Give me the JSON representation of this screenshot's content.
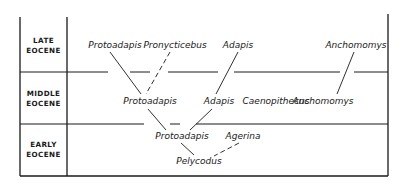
{
  "epochs": [
    {
      "id": "late",
      "line1": "LATE",
      "line2": "EOCENE"
    },
    {
      "id": "middle",
      "line1": "MIDDLE",
      "line2": "EOCENE"
    },
    {
      "id": "early",
      "line1": "EARLY",
      "line2": "EOCENE"
    }
  ],
  "taxa": {
    "late": [
      "Protoadapis",
      "Pronycticebus",
      "Adapis",
      "Anchomomys"
    ],
    "middle": [
      "Protoadapis",
      "Adapis",
      "Caenopithecus",
      "Anchomomys"
    ],
    "early": [
      "Protoadapis",
      "Agerina",
      "Pelycodus"
    ]
  },
  "relationships": [
    {
      "from": "Pelycodus (early)",
      "to": "Protoadapis (early)",
      "style": "solid"
    },
    {
      "from": "Pelycodus (early)",
      "to": "Agerina (early)",
      "style": "dashed"
    },
    {
      "from": "Protoadapis (early)",
      "to": "Protoadapis (middle)",
      "style": "solid"
    },
    {
      "from": "Protoadapis (early)",
      "to": "Adapis (middle)",
      "style": "solid"
    },
    {
      "from": "Protoadapis (middle)",
      "to": "Protoadapis (late)",
      "style": "solid"
    },
    {
      "from": "Protoadapis (middle)",
      "to": "Pronycticebus (late)",
      "style": "dashed"
    },
    {
      "from": "Adapis (middle)",
      "to": "Adapis (late)",
      "style": "solid"
    },
    {
      "from": "Anchomomys (middle)",
      "to": "Anchomomys (late)",
      "style": "solid"
    }
  ]
}
